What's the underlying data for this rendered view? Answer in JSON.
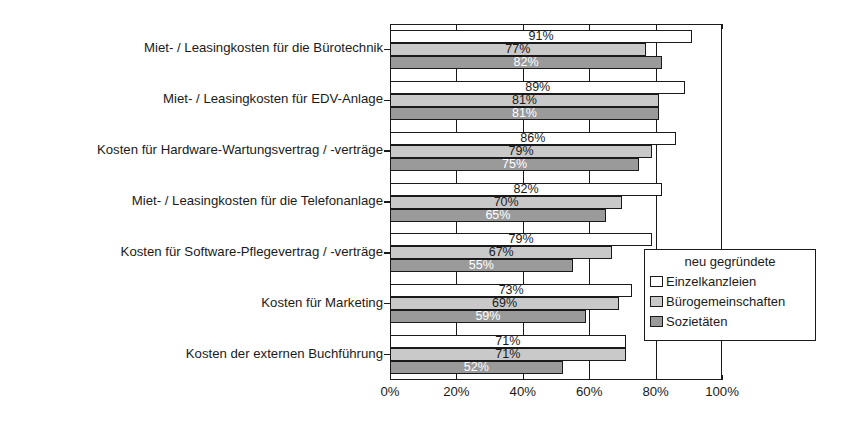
{
  "chart_data": {
    "type": "bar",
    "orientation": "horizontal",
    "title": "",
    "xlabel": "",
    "ylabel": "",
    "xlim": [
      0,
      100
    ],
    "xticks": [
      0,
      20,
      40,
      60,
      80,
      100
    ],
    "xtick_labels": [
      "0%",
      "20%",
      "40%",
      "60%",
      "80%",
      "100%"
    ],
    "grid": true,
    "legend_position": "inside-right",
    "categories": [
      "Miet- / Leasingkosten für die Bürotechnik",
      "Miet- / Leasingkosten für EDV-Anlage",
      "Kosten für Hardware-Wartungsvertrag / -verträge",
      "Miet- / Leasingkosten für die Telefonanlage",
      "Kosten für Software-Pflegevertrag / -verträge",
      "Kosten für Marketing",
      "Kosten der externen Buchführung"
    ],
    "series": [
      {
        "name": "Einzelkanzleien",
        "color": "#ffffff",
        "values": [
          91,
          89,
          86,
          82,
          79,
          73,
          71
        ],
        "labels": [
          "91%",
          "89%",
          "86%",
          "82%",
          "79%",
          "73%",
          "71%"
        ]
      },
      {
        "name": "Bürogemeinschaften",
        "color": "#c9c9c9",
        "values": [
          77,
          81,
          79,
          70,
          67,
          69,
          71
        ],
        "labels": [
          "77%",
          "81%",
          "79%",
          "70%",
          "67%",
          "69%",
          "71%"
        ]
      },
      {
        "name": "Sozietäten",
        "color": "#9a9a9a",
        "values": [
          82,
          81,
          75,
          65,
          55,
          59,
          52
        ],
        "labels": [
          "82%",
          "81%",
          "75%",
          "65%",
          "55%",
          "59%",
          "52%"
        ]
      }
    ]
  },
  "legend": {
    "title": "neu gegründete",
    "items": [
      {
        "label": "Einzelkanzleien",
        "swatch": "s0"
      },
      {
        "label": "Bürogemeinschaften",
        "swatch": "s1"
      },
      {
        "label": "Sozietäten",
        "swatch": "s2"
      }
    ]
  }
}
